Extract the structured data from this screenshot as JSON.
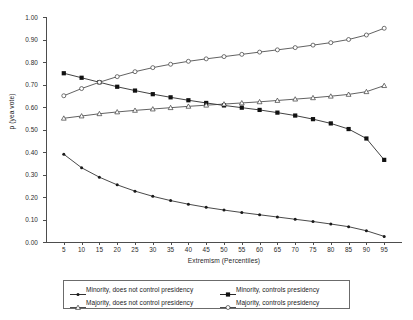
{
  "chart_data": {
    "type": "line",
    "title": "",
    "xlabel": "Extremism (Percentiles)",
    "ylabel": "p (yea vote)",
    "xlim": [
      0,
      100
    ],
    "ylim": [
      0.0,
      1.0
    ],
    "grid": false,
    "legend_position": "bottom",
    "x": [
      5,
      10,
      15,
      20,
      25,
      30,
      35,
      40,
      45,
      50,
      55,
      60,
      65,
      70,
      75,
      80,
      85,
      90,
      95
    ],
    "xticklabels": [
      "5",
      "10",
      "15",
      "20",
      "25",
      "30",
      "35",
      "40",
      "45",
      "50",
      "55",
      "60",
      "65",
      "70",
      "75",
      "80",
      "85",
      "90",
      "95"
    ],
    "yticklabels": [
      "0.00",
      "0.10",
      "0.20",
      "0.30",
      "0.40",
      "0.50",
      "0.60",
      "0.70",
      "0.80",
      "0.90",
      "1.00"
    ],
    "yticks": [
      0.0,
      0.1,
      0.2,
      0.3,
      0.4,
      0.5,
      0.6,
      0.7,
      0.8,
      0.9,
      1.0
    ],
    "series": [
      {
        "name": "Minority, does not control presidency",
        "marker": "small-filled-circle",
        "color": "#1a1a1a",
        "values": [
          0.39,
          0.33,
          0.288,
          0.254,
          0.226,
          0.203,
          0.184,
          0.168,
          0.154,
          0.142,
          0.131,
          0.121,
          0.111,
          0.101,
          0.091,
          0.08,
          0.068,
          0.05,
          0.025
        ]
      },
      {
        "name": "Minority, controls presidency",
        "marker": "filled-square",
        "color": "#111111",
        "values": [
          0.75,
          0.73,
          0.71,
          0.69,
          0.673,
          0.657,
          0.643,
          0.63,
          0.618,
          0.607,
          0.597,
          0.587,
          0.575,
          0.562,
          0.546,
          0.527,
          0.502,
          0.46,
          0.365
        ]
      },
      {
        "name": "Majority, does not control presidency",
        "marker": "open-triangle",
        "color": "#3a3a3a",
        "values": [
          0.55,
          0.56,
          0.57,
          0.578,
          0.585,
          0.591,
          0.597,
          0.603,
          0.608,
          0.613,
          0.618,
          0.623,
          0.629,
          0.635,
          0.641,
          0.648,
          0.656,
          0.668,
          0.695
        ]
      },
      {
        "name": "Majority, controls presidency",
        "marker": "open-circle",
        "color": "#3a3a3a",
        "values": [
          0.65,
          0.682,
          0.71,
          0.735,
          0.757,
          0.775,
          0.79,
          0.803,
          0.814,
          0.824,
          0.834,
          0.844,
          0.854,
          0.864,
          0.875,
          0.886,
          0.9,
          0.92,
          0.95
        ]
      }
    ]
  },
  "legend": {
    "entries": [
      {
        "label": "Minority, does not control presidency",
        "marker": "small-filled-circle"
      },
      {
        "label": "Minority, controls presidency",
        "marker": "filled-square"
      },
      {
        "label": "Majority, does not control presidency",
        "marker": "open-triangle"
      },
      {
        "label": "Majority, controls presidency",
        "marker": "open-circle"
      }
    ]
  }
}
